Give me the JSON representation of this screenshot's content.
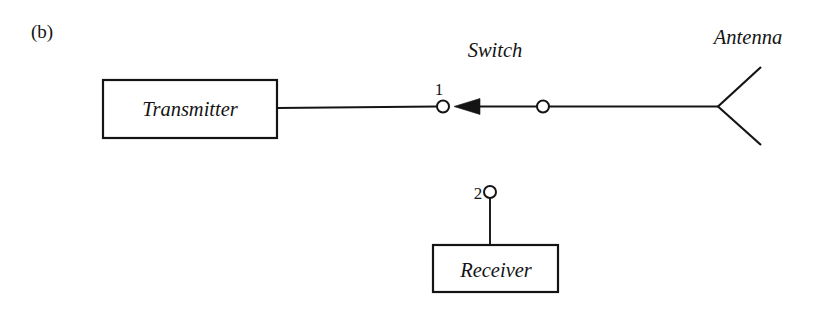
{
  "figure": {
    "panel_label": "(b)",
    "caption_style": "upright-serif"
  },
  "labels": {
    "switch": "Switch",
    "antenna": "Antenna",
    "transmitter": "Transmitter",
    "receiver": "Receiver",
    "terminal_1": "1",
    "terminal_2": "2"
  },
  "colors": {
    "ink": "#141414",
    "background": "#ffffff"
  },
  "diagram": {
    "type": "schematic",
    "blocks": [
      {
        "name": "transmitter",
        "label": "Transmitter",
        "x": 103,
        "y": 80,
        "width": 174,
        "height": 58
      },
      {
        "name": "receiver",
        "label": "Receiver",
        "x": 433,
        "y": 245,
        "width": 125,
        "height": 47
      }
    ],
    "terminals": [
      {
        "name": "terminal-1",
        "label": "1",
        "cx": 443,
        "cy": 106,
        "r": 6,
        "label_x": 438,
        "label_y": 94
      },
      {
        "name": "terminal-2",
        "label": "2",
        "cx": 490,
        "cy": 192,
        "r": 6,
        "label_x": 478,
        "label_y": 198
      }
    ],
    "switch_common_node": {
      "name": "switch-pivot",
      "cx": 543,
      "cy": 106,
      "r": 6
    },
    "switch_blade": {
      "name": "switch-blade-arrow",
      "points": "455,106 479,99 479,113",
      "direction": "points-left-to-terminal-1",
      "connected_to": "terminal-1"
    },
    "wires": [
      {
        "name": "transmitter-to-terminal-1",
        "from": [
          277,
          108
        ],
        "to": [
          437,
          106
        ]
      },
      {
        "name": "blade-to-pivot",
        "from": [
          478,
          106
        ],
        "to": [
          537,
          106
        ]
      },
      {
        "name": "pivot-to-antenna",
        "from": [
          549,
          106
        ],
        "to": [
          718,
          106
        ]
      },
      {
        "name": "terminal-2-to-receiver",
        "from": [
          490,
          198
        ],
        "to": [
          490,
          245
        ]
      }
    ],
    "antenna": {
      "name": "dipole-antenna",
      "vertex": [
        718,
        106
      ],
      "upper_arm_end": [
        761,
        68
      ],
      "lower_arm_end": [
        761,
        144
      ]
    }
  }
}
